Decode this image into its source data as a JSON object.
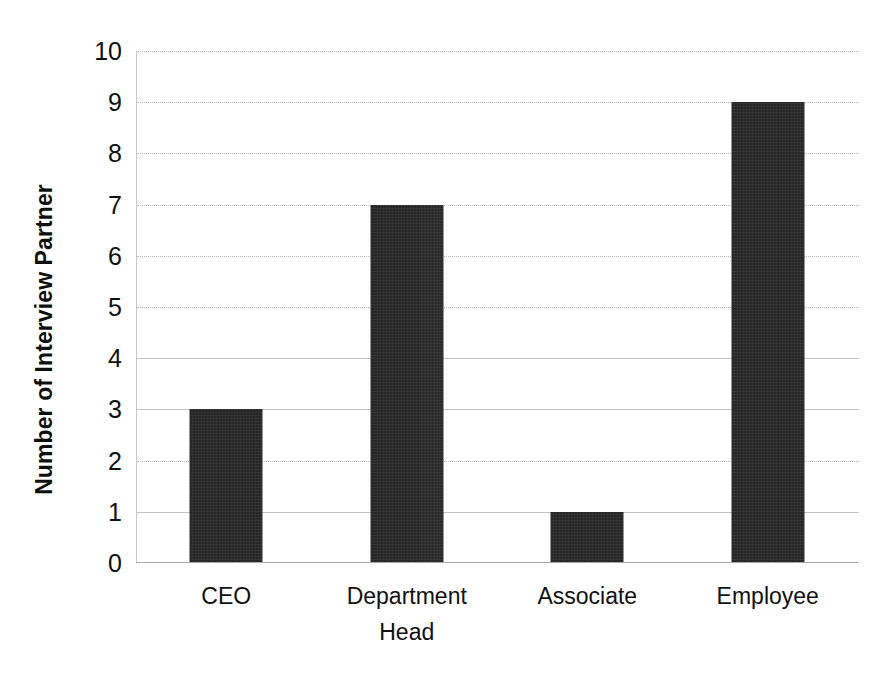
{
  "chart_data": {
    "type": "bar",
    "title": "",
    "subtitle": "",
    "xlabel": "",
    "ylabel": "Number of Interview Partner",
    "categories": [
      "CEO",
      "Department Head",
      "Associate",
      "Employee"
    ],
    "values": [
      3,
      7,
      1,
      9
    ],
    "series": [
      {
        "name": "Number of Interview Partner",
        "values": [
          3,
          7,
          1,
          9
        ]
      }
    ],
    "ylim": [
      0,
      10
    ],
    "ytick_labels": [
      "10",
      "9",
      "8",
      "7",
      "6",
      "5",
      "4",
      "3",
      "2",
      "1",
      "0"
    ],
    "ytick_values": [
      10,
      9,
      8,
      7,
      6,
      5,
      4,
      3,
      2,
      1,
      0
    ],
    "grid": true,
    "grid_axis": "y",
    "legend": false,
    "legend_position": "none",
    "bar_color": "#262626",
    "gridline_color": "#b8b8b8",
    "axis_color": "#a8a8a8",
    "text_color": "#101010"
  },
  "axis": {
    "y_title": "Number of Interview Partner",
    "y_ticks": [
      "10",
      "9",
      "8",
      "7",
      "6",
      "5",
      "4",
      "3",
      "2",
      "1",
      "0"
    ],
    "x_ticks": [
      "CEO",
      "Department\nHead",
      "Associate",
      "Employee"
    ]
  }
}
